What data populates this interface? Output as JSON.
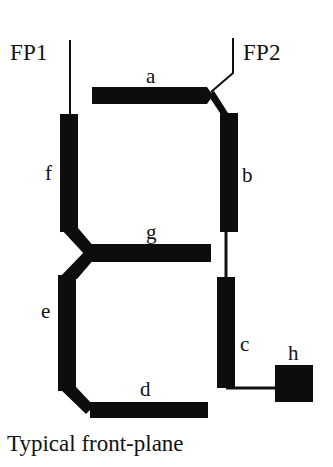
{
  "figure": {
    "caption": "Typical front-plane",
    "background_color": "#ffffff",
    "ink_color": "#0d0d0d",
    "pads": [
      {
        "id": "fp1",
        "label": "FP1",
        "x": 10,
        "y": 41
      },
      {
        "id": "fp2",
        "label": "FP2",
        "x": 243,
        "y": 41
      }
    ],
    "segment_labels": [
      {
        "id": "a",
        "label": "a",
        "x": 146,
        "y": 66
      },
      {
        "id": "b",
        "label": "b",
        "x": 242,
        "y": 165
      },
      {
        "id": "c",
        "label": "c",
        "x": 240,
        "y": 334
      },
      {
        "id": "d",
        "label": "d",
        "x": 140,
        "y": 379
      },
      {
        "id": "e",
        "label": "e",
        "x": 41,
        "y": 301
      },
      {
        "id": "f",
        "label": "f",
        "x": 45,
        "y": 163
      },
      {
        "id": "g",
        "label": "g",
        "x": 146,
        "y": 222
      },
      {
        "id": "h",
        "label": "h",
        "x": 288,
        "y": 343
      }
    ],
    "segments": [
      {
        "id": "a",
        "name": "segment-a-top-bar",
        "shape": "polygon",
        "points": "92,87 207,87 213,95.5 207,104 92,104"
      },
      {
        "id": "b",
        "name": "segment-b-upper-right-bar",
        "shape": "polygon",
        "points": "220,113 238,113 238,232 220,232"
      },
      {
        "id": "c",
        "name": "segment-c-lower-right-bar",
        "shape": "polygon",
        "points": "217,277 235,277 235,388 217,388"
      },
      {
        "id": "d",
        "name": "segment-d-bottom-bar",
        "shape": "polygon",
        "points": "90,402 208,402 208,418 90,418"
      },
      {
        "id": "e",
        "name": "segment-e-lower-left-bar",
        "shape": "polygon",
        "points": "58,275 76,275 76,391 58,391"
      },
      {
        "id": "f",
        "name": "segment-f-upper-left-bar",
        "shape": "polygon",
        "points": "60,114 78,114 78,232 60,232"
      },
      {
        "id": "g",
        "name": "segment-g-middle-bar",
        "shape": "polygon",
        "points": "92,244 211,244 211,262 92,262 86,253"
      },
      {
        "id": "h",
        "name": "segment-h-decimal-point-pad",
        "shape": "polygon",
        "points": "275,365 313,365 313,402 275,402"
      }
    ],
    "connectors": [
      {
        "id": "fp1-lead",
        "name": "fp1-lead-line",
        "shape": "polyline",
        "points": "70,40 70,114",
        "width": 2
      },
      {
        "id": "fp2-lead",
        "name": "fp2-lead-line",
        "shape": "polyline",
        "points": "233,38 233,73 211,92",
        "width": 2
      },
      {
        "id": "a-to-b-link",
        "name": "segment-a-to-segment-b-link",
        "shape": "polygon",
        "points": "208,95 220,113 228,113 214,91"
      },
      {
        "id": "f-to-g-link",
        "name": "segment-f-to-segment-g-link",
        "shape": "polygon",
        "points": "60,228 78,228 95,248 86,256"
      },
      {
        "id": "g-to-e-link",
        "name": "segment-g-to-segment-e-link",
        "shape": "polygon",
        "points": "86,250 95,258 77,279 58,279"
      },
      {
        "id": "e-to-d-link",
        "name": "segment-e-to-segment-d-link",
        "shape": "polygon",
        "points": "58,387 76,387 94,406 86,414"
      },
      {
        "id": "b-to-c-link",
        "name": "segment-b-to-segment-c-link",
        "shape": "polyline",
        "points": "226,232 226,277",
        "width": 3
      },
      {
        "id": "c-to-h-link",
        "name": "segment-c-to-segment-h-link",
        "shape": "polyline",
        "points": "226,388 276,388",
        "width": 3
      }
    ]
  }
}
